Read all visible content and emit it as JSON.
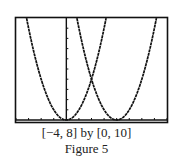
{
  "chart_data": {
    "type": "line",
    "title": "",
    "xlabel": "",
    "ylabel": "",
    "xlim": [
      -4,
      8
    ],
    "ylim": [
      0,
      10
    ],
    "x_tick_step": 1,
    "y_tick_step": 1,
    "grid": false,
    "legend": null,
    "series": [
      {
        "name": "y = x^2",
        "formula": "x^2",
        "vertex": [
          0,
          0
        ]
      },
      {
        "name": "y = (x - 4)^2",
        "formula": "(x-4)^2",
        "vertex": [
          4,
          0
        ]
      }
    ],
    "annotations": [
      {
        "label": "intersection",
        "point": [
          2,
          4
        ]
      }
    ]
  },
  "caption": {
    "window": "[−4, 8] by [0, 10]",
    "figure": "Figure 5"
  },
  "colors": {
    "curve": "#111111",
    "frame": "#111111",
    "background": "#ffffff"
  }
}
